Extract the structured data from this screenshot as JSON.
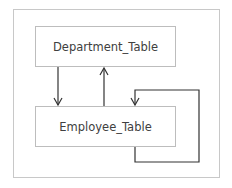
{
  "diagram": {
    "nodes": [
      {
        "id": "dept",
        "label": "Department_Table"
      },
      {
        "id": "emp",
        "label": "Employee_Table"
      }
    ],
    "edges": [
      {
        "from": "Department_Table",
        "to": "Employee_Table"
      },
      {
        "from": "Employee_Table",
        "to": "Department_Table"
      },
      {
        "from": "Employee_Table",
        "to": "Employee_Table"
      }
    ],
    "colors": {
      "line": "#333333",
      "border": "#bdbdbd",
      "frame": "#c8c8c8",
      "text": "#404040"
    }
  }
}
